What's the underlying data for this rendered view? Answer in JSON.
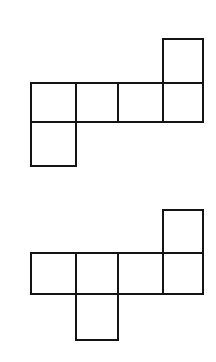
{
  "diagram": {
    "type": "cube-nets",
    "stroke_color": "#141414",
    "background": "#ffffff",
    "nets": [
      {
        "name": "net-1",
        "cells": [
          {
            "x": 163,
            "y": 39,
            "w": 40,
            "h": 44
          },
          {
            "x": 31,
            "y": 83,
            "w": 45,
            "h": 39
          },
          {
            "x": 76,
            "y": 83,
            "w": 42,
            "h": 39
          },
          {
            "x": 118,
            "y": 83,
            "w": 45,
            "h": 39
          },
          {
            "x": 163,
            "y": 83,
            "w": 40,
            "h": 39
          },
          {
            "x": 31,
            "y": 122,
            "w": 45,
            "h": 44
          }
        ]
      },
      {
        "name": "net-2",
        "cells": [
          {
            "x": 163,
            "y": 210,
            "w": 40,
            "h": 43
          },
          {
            "x": 31,
            "y": 253,
            "w": 45,
            "h": 41
          },
          {
            "x": 76,
            "y": 253,
            "w": 42,
            "h": 41
          },
          {
            "x": 118,
            "y": 253,
            "w": 45,
            "h": 41
          },
          {
            "x": 163,
            "y": 253,
            "w": 40,
            "h": 41
          },
          {
            "x": 76,
            "y": 294,
            "w": 42,
            "h": 46
          }
        ]
      }
    ]
  }
}
